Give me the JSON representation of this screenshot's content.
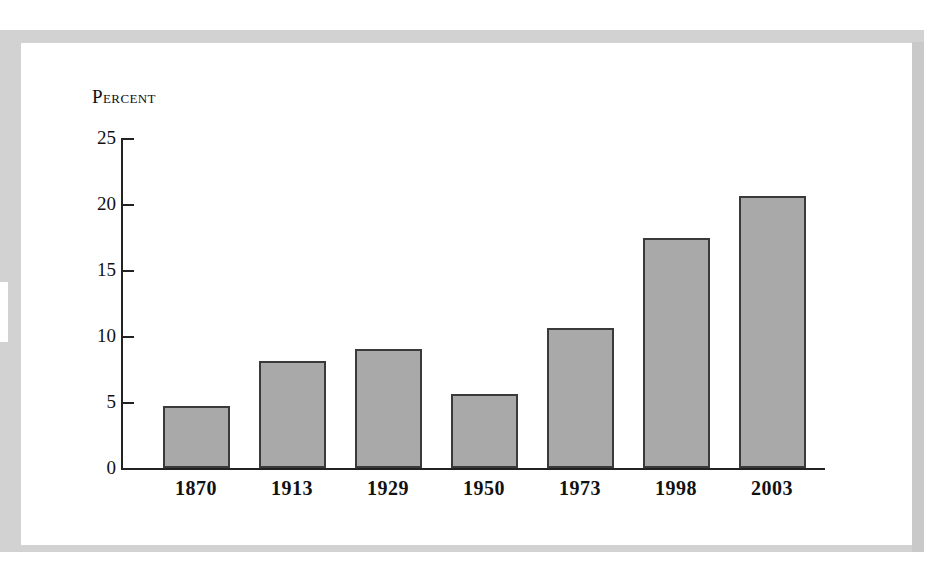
{
  "chart_data": {
    "type": "bar",
    "title": "",
    "subtitle": "",
    "ylabel": "Percent",
    "xlabel": "",
    "categories": [
      "1870",
      "1913",
      "1929",
      "1950",
      "1973",
      "1998",
      "2003"
    ],
    "values": [
      4.7,
      8.1,
      9.0,
      5.6,
      10.6,
      17.4,
      20.6
    ],
    "ylim": [
      0,
      25
    ],
    "yticks": [
      0,
      5,
      10,
      15,
      20,
      25
    ],
    "ytick_labels": [
      "0",
      "5",
      "10",
      "15",
      "20",
      "25"
    ],
    "grid": false,
    "legend": null,
    "legend_position": "none",
    "series": [
      {
        "name": "Percent",
        "values": [
          4.7,
          8.1,
          9.0,
          5.6,
          10.6,
          17.4,
          20.6
        ]
      }
    ],
    "annotations": [],
    "colors": {
      "bar_fill": "#a9a9a9",
      "bar_edge": "#3a3a3a",
      "axis": "#222222",
      "text": "#111111",
      "frame": "#d2d2d2",
      "background": "#ffffff"
    }
  }
}
